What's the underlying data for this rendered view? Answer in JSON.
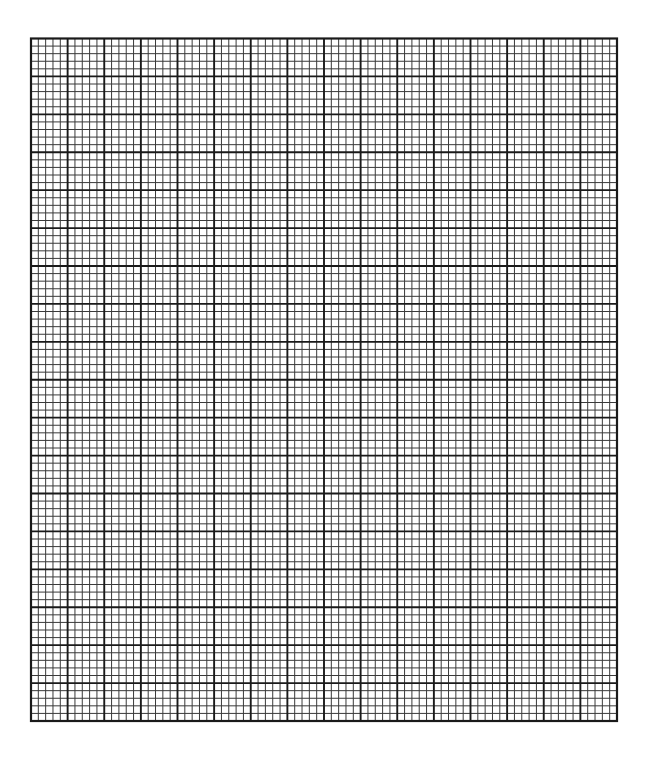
{
  "page": {
    "width": 649,
    "height": 762,
    "background": "#ffffff"
  },
  "graph_paper": {
    "x": 31,
    "y": 38.5,
    "width": 586,
    "height": 682.5,
    "major_columns": 16,
    "major_rows": 18,
    "minor_per_major": 5,
    "line_color": "#1a1a1a",
    "minor_line_color": "#3a3a3a",
    "border_width": 2.2,
    "major_line_width": 1.9,
    "minor_line_width": 1.0
  }
}
